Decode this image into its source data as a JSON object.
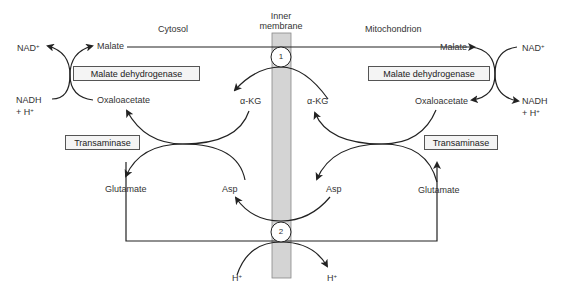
{
  "regions": {
    "cytosol": "Cytosol",
    "membrane_line1": "Inner",
    "membrane_line2": "membrane",
    "mitochondrion": "Mitochondrion"
  },
  "enzymes": {
    "mdh_left": "Malate dehydrogenase",
    "mdh_right": "Malate dehydrogenase",
    "transaminase_left": "Transaminase",
    "transaminase_right": "Transaminase"
  },
  "cytosol": {
    "nad": "NAD",
    "nad_sup": "+",
    "nadh": "NADH",
    "h_plus_prefix": "+ H",
    "h_sup": "+",
    "malate": "Malate",
    "oxaloacetate": "Oxaloacetate",
    "akg": "α-KG",
    "glutamate": "Glutamate",
    "asp": "Asp"
  },
  "mitochondrion": {
    "nad": "NAD",
    "nad_sup": "+",
    "nadh": "NADH",
    "h_plus_prefix": "+ H",
    "h_sup": "+",
    "malate": "Malate",
    "oxaloacetate": "Oxaloacetate",
    "akg": "α-KG",
    "glutamate": "Glutamate",
    "asp": "Asp"
  },
  "transporters": {
    "t1": "1",
    "t2": "2"
  },
  "protons": {
    "h_left": "H",
    "h_left_sup": "+",
    "h_right": "H",
    "h_right_sup": "+"
  },
  "colors": {
    "membrane_fill": "#d4d4d4",
    "line": "#222222",
    "box_fill": "#f4f4f4"
  }
}
